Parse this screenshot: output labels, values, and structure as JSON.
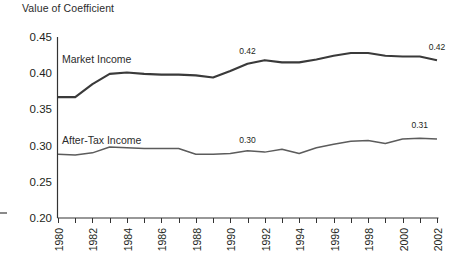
{
  "chart_data": {
    "type": "line",
    "title": "Value of Coefficient",
    "xlabel": "",
    "ylabel": "Value of Coefficient",
    "ylim": [
      0.2,
      0.45
    ],
    "yticks": [
      "0.20",
      "0.25",
      "0.30",
      "0.35",
      "0.40",
      "0.45"
    ],
    "ytick_values": [
      0.2,
      0.25,
      0.3,
      0.35,
      0.4,
      0.45
    ],
    "xlim": [
      1980,
      2002
    ],
    "grid": false,
    "legend": "inline-labels",
    "x": [
      1980,
      1981,
      1982,
      1983,
      1984,
      1985,
      1986,
      1987,
      1988,
      1989,
      1990,
      1991,
      1992,
      1993,
      1994,
      1995,
      1996,
      1997,
      1998,
      1999,
      2000,
      2001,
      2002
    ],
    "xticks": [
      "1980",
      "1981",
      "1982",
      "1983",
      "1984",
      "1985",
      "1986",
      "1987",
      "1988",
      "1989",
      "1990",
      "1991",
      "1992",
      "1993",
      "1994",
      "1995",
      "1996",
      "1997",
      "1998",
      "1999",
      "2000",
      "2001",
      "2002"
    ],
    "xtick_labels_shown": [
      "1980",
      "1982",
      "1984",
      "1986",
      "1988",
      "1990",
      "1992",
      "1994",
      "1996",
      "1998",
      "2000",
      "2002"
    ],
    "series": [
      {
        "name": "Market Income",
        "label": "Market Income",
        "color": "#3a3a3a",
        "values": [
          0.367,
          0.367,
          0.385,
          0.399,
          0.401,
          0.399,
          0.398,
          0.398,
          0.397,
          0.394,
          0.403,
          0.413,
          0.418,
          0.415,
          0.415,
          0.419,
          0.424,
          0.428,
          0.428,
          0.424,
          0.423,
          0.423,
          0.418
        ]
      },
      {
        "name": "After-Tax Income",
        "label": "After-Tax Income",
        "color": "#5c5c5c",
        "values": [
          0.288,
          0.287,
          0.29,
          0.298,
          0.297,
          0.296,
          0.296,
          0.296,
          0.288,
          0.288,
          0.289,
          0.293,
          0.291,
          0.295,
          0.289,
          0.297,
          0.302,
          0.306,
          0.307,
          0.303,
          0.309,
          0.31,
          0.309
        ]
      }
    ],
    "annotations": [
      {
        "text": "0.42",
        "series": "Market Income",
        "x": 1991,
        "y": 0.413,
        "dy": -10
      },
      {
        "text": "0.42",
        "series": "Market Income",
        "x": 2002,
        "y": 0.418,
        "dy": -10
      },
      {
        "text": "0.30",
        "series": "After-Tax Income",
        "x": 1991,
        "y": 0.293,
        "dy": -8
      },
      {
        "text": "0.31",
        "series": "After-Tax Income",
        "x": 2001,
        "y": 0.31,
        "dy": -10
      }
    ],
    "series_label_positions": [
      {
        "text": "Market Income",
        "px": 62,
        "py": 63
      },
      {
        "text": "After-Tax Income",
        "px": 62,
        "py": 144
      }
    ]
  }
}
